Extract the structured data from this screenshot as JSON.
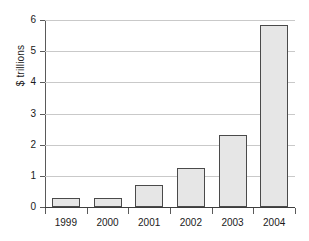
{
  "chart_data": {
    "type": "bar",
    "title": "",
    "xlabel": "",
    "ylabel": "$ trillions",
    "categories": [
      "1999",
      "2000",
      "2001",
      "2002",
      "2003",
      "2004"
    ],
    "values": [
      0.3,
      0.3,
      0.7,
      1.25,
      2.3,
      5.85
    ],
    "ylim": [
      0,
      6
    ],
    "ytick_labels": [
      "0",
      "1",
      "2",
      "3",
      "4",
      "5",
      "6"
    ],
    "ytick_values": [
      0,
      1,
      2,
      3,
      4,
      5,
      6
    ],
    "grid": true,
    "legend": "none",
    "series": [
      {
        "name": "",
        "values": [
          0.3,
          0.3,
          0.7,
          1.25,
          2.3,
          5.85
        ]
      }
    ]
  },
  "style": {
    "bar_fill": "#e6e6e6",
    "bar_border": "#4a4a4a",
    "grid_color": "#c9c9c9",
    "axis_color": "#5a5a5a",
    "text_color": "#1a1a1a",
    "background": "#ffffff"
  }
}
